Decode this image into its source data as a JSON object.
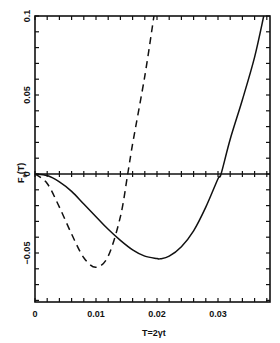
{
  "chart_data": {
    "type": "line",
    "title": "",
    "xlabel": "T=2γt",
    "ylabel": "F_θ(T)",
    "xlim": [
      0,
      0.04
    ],
    "ylim": [
      -0.08,
      0.1
    ],
    "xticks": [
      0,
      0.01,
      0.02,
      0.03
    ],
    "xtick_labels": [
      "0",
      "0.01",
      "0.02",
      "0.03"
    ],
    "yticks": [
      -0.05,
      0,
      0.05,
      0.1
    ],
    "ytick_labels": [
      "-0.05",
      "0",
      "0.05",
      "0.1"
    ],
    "grid": false,
    "zero_line": true,
    "legend": null,
    "series": [
      {
        "name": "solid",
        "style": "solid",
        "x": [
          0,
          0.002,
          0.004,
          0.006,
          0.008,
          0.01,
          0.012,
          0.014,
          0.016,
          0.018,
          0.02,
          0.0205,
          0.022,
          0.024,
          0.026,
          0.028,
          0.03,
          0.0305,
          0.032,
          0.034,
          0.036,
          0.0375
        ],
        "y": [
          0,
          -0.001,
          -0.005,
          -0.011,
          -0.019,
          -0.027,
          -0.035,
          -0.042,
          -0.048,
          -0.052,
          -0.0535,
          -0.0537,
          -0.052,
          -0.046,
          -0.036,
          -0.021,
          -0.003,
          0,
          0.022,
          0.047,
          0.074,
          0.1
        ]
      },
      {
        "name": "dashed",
        "style": "dashed",
        "x": [
          0,
          0.002,
          0.004,
          0.006,
          0.008,
          0.01,
          0.012,
          0.014,
          0.0152,
          0.016,
          0.018,
          0.0195
        ],
        "y": [
          0,
          -0.006,
          -0.021,
          -0.038,
          -0.053,
          -0.059,
          -0.052,
          -0.027,
          0,
          0.019,
          0.062,
          0.1
        ]
      }
    ]
  },
  "axes": {
    "xlabel": "T=2γt",
    "ylabel_main": "F",
    "ylabel_sub": "θ",
    "ylabel_arg": "(T)"
  }
}
